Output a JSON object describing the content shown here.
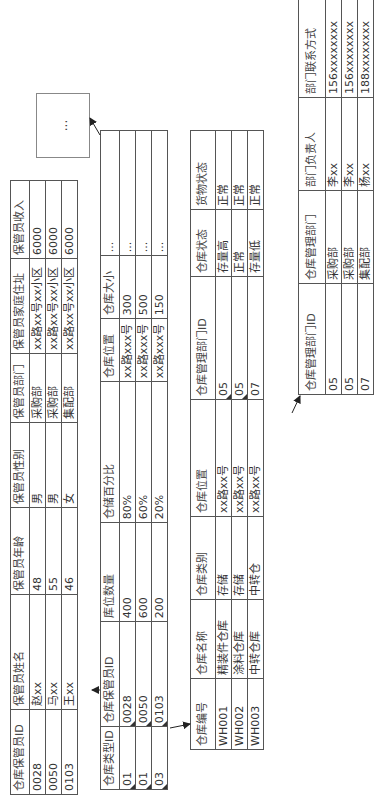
{
  "tables": {
    "keeper": {
      "headers": [
        "仓库保管员ID",
        "保管员姓名",
        "保管员年龄",
        "保管员性别",
        "保管员部门",
        "保管员家庭住址",
        "保管员收入"
      ],
      "rows": [
        [
          "0028",
          "赵xx",
          "48",
          "男",
          "采购部",
          "xx路xx号xx小区",
          "6000"
        ],
        [
          "0050",
          "马xx",
          "55",
          "男",
          "采购部",
          "xx路xx号xx小区",
          "6000"
        ],
        [
          "0103",
          "王xx",
          "46",
          "女",
          "集配部",
          "xx路xx号xx小区",
          "6000"
        ]
      ]
    },
    "warehouse_type": {
      "headers": [
        "仓库类型ID",
        "仓库保管员ID",
        "库位数量",
        "仓储百分比",
        "仓库位置",
        "仓库大小",
        "..."
      ],
      "rows": [
        [
          "01",
          "0028",
          "400",
          "80%",
          "xx路xxx号",
          "300",
          "..."
        ],
        [
          "01",
          "0050",
          "600",
          "60%",
          "xx路xxx号",
          "500",
          "..."
        ],
        [
          "03",
          "0103",
          "200",
          "20%",
          "xx路xxx号",
          "150",
          "..."
        ]
      ]
    },
    "warehouse": {
      "headers": [
        "仓库编号",
        "仓库名称",
        "仓库类别",
        "仓库位置",
        "仓库管理部门ID",
        "仓库状态",
        "货物状态"
      ],
      "rows": [
        [
          "WH001",
          "精装件仓库",
          "存储",
          "xx路xx号",
          "05",
          "存量高",
          "正常"
        ],
        [
          "WH002",
          "涂料仓库",
          "存储",
          "xx路xx号",
          "05",
          "正常",
          "正常"
        ],
        [
          "WH003",
          "中转仓库",
          "中转仓",
          "xx路xx号",
          "07",
          "存量低",
          "正常"
        ]
      ]
    },
    "department": {
      "headers": [
        "仓库管理部门ID",
        "仓库管理部门",
        "部门负责人",
        "部门联系方式"
      ],
      "rows": [
        [
          "05",
          "采购部",
          "李xx",
          "156xxxxxxxx"
        ],
        [
          "05",
          "采购部",
          "李xx",
          "156xxxxxxxx"
        ],
        [
          "07",
          "集配部",
          "杨xx",
          "188xxxxxxxx"
        ]
      ]
    }
  },
  "ellipsis_box": {
    "label": "..."
  }
}
